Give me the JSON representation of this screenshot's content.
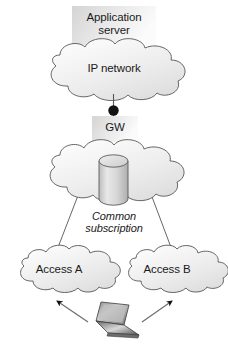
{
  "diagram": {
    "nodes": {
      "app_server": {
        "label": "Application\nserver",
        "shape": "box",
        "icon": "server-box-icon"
      },
      "ip_network": {
        "label": "IP network",
        "shape": "cloud",
        "icon": "cloud-icon"
      },
      "gateway": {
        "label": "GW",
        "shape": "box",
        "icon": "gateway-box-icon"
      },
      "core_cloud": {
        "label": "",
        "shape": "cloud",
        "icon": "cloud-icon"
      },
      "subscription_db": {
        "label": "Common\nsubscription",
        "shape": "cylinder",
        "icon": "database-cylinder-icon"
      },
      "access_a": {
        "label": "Access A",
        "shape": "cloud",
        "icon": "cloud-icon"
      },
      "access_b": {
        "label": "Access B",
        "shape": "cloud",
        "icon": "cloud-icon"
      },
      "terminal": {
        "label": "",
        "shape": "laptop",
        "icon": "laptop-icon"
      }
    },
    "connectors": [
      {
        "from": "ip_network",
        "to": "gateway",
        "style": "line-with-node-dot"
      },
      {
        "from": "gateway",
        "to": "access_a",
        "style": "line"
      },
      {
        "from": "gateway",
        "to": "access_b",
        "style": "line"
      },
      {
        "from": "terminal",
        "to": "access_a",
        "style": "arrow"
      },
      {
        "from": "terminal",
        "to": "access_b",
        "style": "arrow"
      }
    ],
    "colors": {
      "stroke": "#4d4d4d",
      "text": "#1a1a1a",
      "fill_light": "#ffffff",
      "fill_mid": "#e2e2e2",
      "fill_dark": "#c9c9c9",
      "node_dot": "#111111",
      "background": "#ffffff"
    }
  }
}
